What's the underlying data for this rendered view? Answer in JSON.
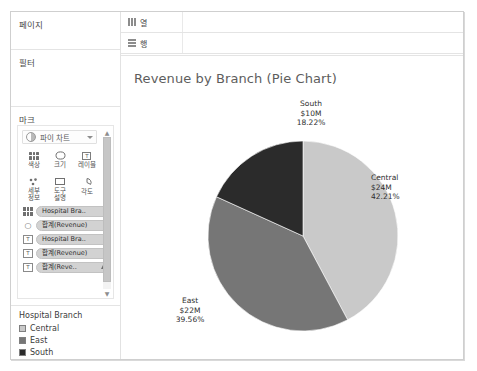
{
  "app": {
    "shelves": {
      "pages_label": "페이지",
      "filters_label": "필터",
      "marks_label": "마크",
      "columns_label": "열",
      "rows_label": "행"
    }
  },
  "marks_card": {
    "mark_type": "파이 차트",
    "buttons": [
      {
        "name": "color",
        "label": "색상",
        "icon": "dots-icon"
      },
      {
        "name": "size",
        "label": "크기",
        "icon": "size-icon"
      },
      {
        "name": "label",
        "label": "레이블",
        "icon": "text-icon"
      },
      {
        "name": "detail",
        "label": "세부\n정보",
        "icon": "detail-icon"
      },
      {
        "name": "tooltip",
        "label": "도구\n설명",
        "icon": "tooltip-icon"
      },
      {
        "name": "angle",
        "label": "각도",
        "icon": "angle-icon"
      }
    ],
    "pills": [
      {
        "icon": "color-dots-icon",
        "text": "Hospital Bra..",
        "has_sort": false
      },
      {
        "icon": "size-icon",
        "text": "합계(Revenue)",
        "has_sort": false
      },
      {
        "icon": "text-icon",
        "text": "Hospital Bra..",
        "has_sort": false
      },
      {
        "icon": "text-icon",
        "text": "합계(Revenue)",
        "has_sort": false
      },
      {
        "icon": "text-icon",
        "text": "합계(Reve..",
        "has_sort": true
      }
    ]
  },
  "legend": {
    "title": "Hospital Branch",
    "items": [
      {
        "label": "Central",
        "color": "#c9c9c9"
      },
      {
        "label": "East",
        "color": "#767676"
      },
      {
        "label": "South",
        "color": "#2b2b2b"
      }
    ]
  },
  "chart_data": {
    "type": "pie",
    "title": "Revenue by Branch (Pie Chart)",
    "categories": [
      "Central",
      "East",
      "South"
    ],
    "values": [
      24,
      22,
      10
    ],
    "value_labels": [
      "$24M",
      "$22M",
      "$10M"
    ],
    "percentages": [
      42.21,
      39.56,
      18.22
    ],
    "percent_labels": [
      "42.21%",
      "39.56%",
      "18.22%"
    ],
    "colors": [
      "#c9c9c9",
      "#767676",
      "#2b2b2b"
    ],
    "start_angle_deg": 0,
    "direction": "clockwise",
    "legend_position": "left",
    "grid": false,
    "xlabel": "",
    "ylabel": "",
    "labels": [
      {
        "category": "Central",
        "lines": [
          "Central",
          "$24M",
          "42.21%"
        ]
      },
      {
        "category": "East",
        "lines": [
          "East",
          "$22M",
          "39.56%"
        ]
      },
      {
        "category": "South",
        "lines": [
          "South",
          "$10M",
          "18.22%"
        ]
      }
    ]
  }
}
